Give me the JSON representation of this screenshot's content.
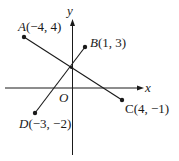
{
  "diagram": {
    "axes": {
      "x_label": "x",
      "y_label": "y",
      "origin_label": "O"
    },
    "points": [
      {
        "name": "A",
        "coords": "(−4, 4)",
        "x": -4,
        "y": 4
      },
      {
        "name": "B",
        "coords": "(1, 3)",
        "x": 1,
        "y": 3
      },
      {
        "name": "C",
        "coords": "(4, −1)",
        "x": 4,
        "y": -1
      },
      {
        "name": "D",
        "coords": "(−3, −2)",
        "x": -3,
        "y": -2
      }
    ],
    "segments": [
      {
        "from": "A",
        "to": "C"
      },
      {
        "from": "D",
        "to": "B"
      }
    ],
    "colors": {
      "ink": "#1a1a1a",
      "background": "#ffffff"
    }
  }
}
